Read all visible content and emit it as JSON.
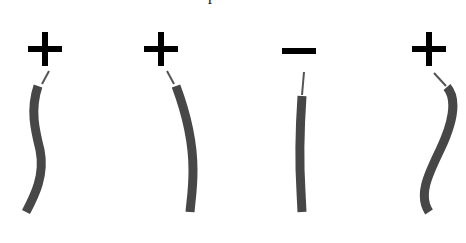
{
  "diagram": {
    "top_cut_text": "p",
    "colors": {
      "sign": "#000000",
      "wire": "#474747",
      "lead": "#555555",
      "background": "#ffffff"
    },
    "items": [
      {
        "label": "+",
        "polarity": "positive",
        "sign": {
          "cx": 45,
          "cy": 49
        },
        "lead": "M49,71 L42,84",
        "wire": "M38,86 C30,110 35,130 40,150 C45,175 35,195 26,212"
      },
      {
        "label": "+",
        "polarity": "positive",
        "sign": {
          "cx": 161,
          "cy": 49
        },
        "lead": "M167,71 L174,84",
        "wire": "M176,86 C185,110 193,140 193,170 C193,190 191,200 190,212"
      },
      {
        "label": "−",
        "polarity": "negative",
        "sign": {
          "cx": 299,
          "cy": 51
        },
        "lead": "M304,72 L302,95",
        "wire": "M302,96 C300,125 299,160 301,192 L302,212"
      },
      {
        "label": "+",
        "polarity": "positive",
        "sign": {
          "cx": 429,
          "cy": 49
        },
        "lead": "M434,73 L446,86",
        "wire": "M447,87 C458,100 452,125 440,150 C428,175 418,195 429,212"
      }
    ]
  }
}
